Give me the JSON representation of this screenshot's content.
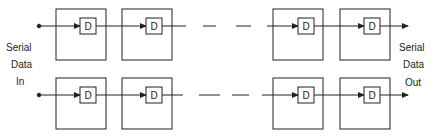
{
  "diagram": {
    "type": "shift-register-chain",
    "input_label": [
      "Serial",
      "Data",
      "In"
    ],
    "output_label": [
      "Serial",
      "Data",
      "Out"
    ],
    "flipflop_label": "D",
    "rows": [
      {
        "name": "top",
        "stages": [
          "D",
          "D",
          "D",
          "D"
        ],
        "gap": "dashed"
      },
      {
        "name": "bottom",
        "stages": [
          "D",
          "D",
          "D",
          "D"
        ],
        "gap": "dashed"
      }
    ],
    "colors": {
      "line": "#222222",
      "fill": "#ffffff"
    }
  }
}
